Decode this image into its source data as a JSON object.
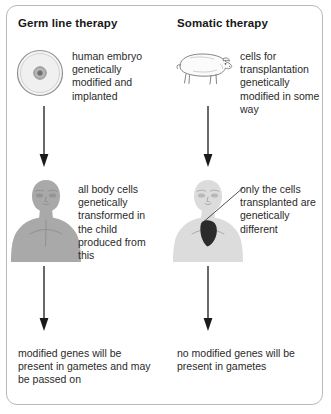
{
  "figure": {
    "border_color": "#b9b9b9",
    "background_color": "#ffffff",
    "text_color": "#2a2a2a"
  },
  "columns": {
    "germ_line": {
      "heading": "Germ line therapy",
      "step1_caption": "human embryo genetically modified and implanted",
      "step2_caption": "all body cells genetically transformed in the child produced from this",
      "outcome": "modified genes will be present in gametes and may be passed on",
      "icon_step1": "embryo-cell-icon",
      "icon_step2": "human-figure-icon"
    },
    "somatic": {
      "heading": "Somatic therapy",
      "step1_caption": "cells for transplantation genetically modified in some way",
      "step2_caption": "only the cells transplanted are genetically different",
      "outcome": "no modified genes will be present in gametes",
      "icon_step1": "pig-icon",
      "icon_step2": "human-figure-with-heart-icon"
    }
  },
  "connectors": {
    "arrow_icon": "down-arrow-icon",
    "leader_line_icon": "leader-line-icon",
    "arrow_color": "#1a1a1a"
  },
  "art_colors": {
    "embryo_outline": "#8e8e8e",
    "embryo_fill": "#f2f2f2",
    "embryo_nucleus": "#9a9a9a",
    "person_left_fill": "#a8a8a8",
    "person_right_fill": "#d8d8d8",
    "transplanted_organ": "#2b2b2b",
    "pig_outline": "#6e6e6e",
    "pig_fill": "#fafafa"
  }
}
